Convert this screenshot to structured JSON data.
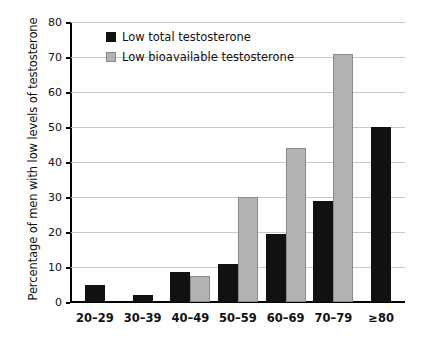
{
  "chart_data": {
    "type": "bar",
    "title": "",
    "subtitle": "",
    "xlabel": "",
    "ylabel": "Percentage of men with low levels of testosterone",
    "ylim": [
      0,
      80
    ],
    "ytick_step": 10,
    "yticks": [
      0,
      10,
      20,
      30,
      40,
      50,
      60,
      70,
      80
    ],
    "grid": "horizontal",
    "legend_position": "top-left-inside",
    "categories": [
      "20–29",
      "30–39",
      "40–49",
      "50–59",
      "60–69",
      "70–79",
      "≥80"
    ],
    "series": [
      {
        "name": "Low total testosterone",
        "color": "#111111",
        "values": [
          5,
          2,
          8.5,
          11,
          19.5,
          29,
          50
        ]
      },
      {
        "name": "Low bioavailable testosterone",
        "color": "#b2b2b2",
        "values": [
          0,
          0,
          7.5,
          30,
          44,
          71,
          0
        ]
      }
    ]
  },
  "axis": {
    "y_title": "Percentage of men with low levels of testosterone",
    "y_tick_labels": [
      "0",
      "10",
      "20",
      "30",
      "40",
      "50",
      "60",
      "70",
      "80"
    ],
    "x_tick_labels": [
      "20–29",
      "30–39",
      "40–49",
      "50–59",
      "60–69",
      "70–79",
      "≥80"
    ]
  },
  "legend": {
    "items": [
      {
        "label": "Low total testosterone",
        "swatch": "black-square-icon"
      },
      {
        "label": "Low bioavailable testosterone",
        "swatch": "gray-square-icon"
      }
    ]
  },
  "colors": {
    "series_total": "#111111",
    "series_bioavailable": "#b2b2b2",
    "gridline": "#c8c8c8",
    "axis": "#000000",
    "background": "#ffffff"
  }
}
